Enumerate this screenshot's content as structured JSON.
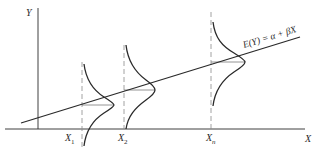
{
  "diagram": {
    "title": "",
    "axes": {
      "y_label": "Y",
      "x_label": "X"
    },
    "regression_line": {
      "label": "E(Y) = α + βX"
    },
    "x_points": [
      {
        "label_main": "X",
        "label_sub": "1"
      },
      {
        "label_main": "X",
        "label_sub": "2"
      },
      {
        "label_main": "X",
        "label_sub": "n"
      }
    ],
    "colors": {
      "ink": "#2a2a2a",
      "dashed": "#8a8a8a",
      "mean_line": "#7a7a7a"
    }
  }
}
